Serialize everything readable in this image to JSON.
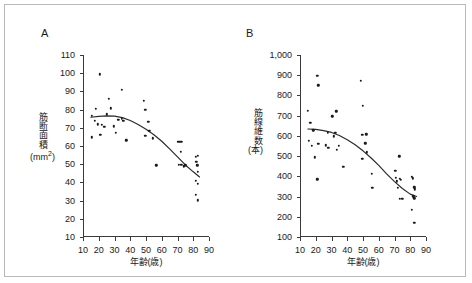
{
  "figure": {
    "panels": [
      {
        "label": "A",
        "ylabel_main": "筋断面積",
        "ylabel_unit": "(mm2)",
        "xlabel": "年齢(歳)"
      },
      {
        "label": "B",
        "ylabel_main": "筋線維数",
        "ylabel_unit": "(本)",
        "xlabel": "年齢(歳)"
      }
    ],
    "border_color": "#b9b9b9",
    "marker_color": "#1a1a1a",
    "axis_color": "#3a3a3a"
  },
  "chart_data": [
    {
      "type": "scatter",
      "panel": "A",
      "title": "",
      "xlabel": "年齢(歳)",
      "ylabel": "筋断面積 (mm2)",
      "xlim": [
        10,
        90
      ],
      "ylim": [
        10,
        110
      ],
      "xticks": [
        10,
        20,
        30,
        40,
        50,
        60,
        70,
        80,
        90
      ],
      "yticks": [
        10,
        20,
        30,
        40,
        50,
        60,
        70,
        80,
        90,
        100,
        110
      ],
      "xtick_labels": [
        "10",
        "20",
        "30",
        "40",
        "50",
        "60",
        "70",
        "80",
        "90"
      ],
      "ytick_labels": [
        "10",
        "20",
        "30",
        "40",
        "50",
        "60",
        "70",
        "80",
        "90",
        "100",
        "110"
      ],
      "grid": false,
      "legend": "none",
      "points": [
        [
          15.5,
          76.5
        ],
        [
          15.5,
          64.8
        ],
        [
          17.5,
          74.0
        ],
        [
          18.0,
          80.5
        ],
        [
          19.5,
          72.0
        ],
        [
          20.5,
          99.3
        ],
        [
          21.0,
          66.2
        ],
        [
          22.0,
          71.5
        ],
        [
          23.5,
          70.5
        ],
        [
          25.0,
          77.5
        ],
        [
          26.5,
          86.0
        ],
        [
          27.5,
          80.7
        ],
        [
          29.5,
          70.8
        ],
        [
          31.0,
          67.3
        ],
        [
          32.5,
          74.3
        ],
        [
          34.5,
          91.0
        ],
        [
          34.5,
          75.0
        ],
        [
          35.5,
          74.0
        ],
        [
          37.5,
          63.2
        ],
        [
          48.5,
          84.8
        ],
        [
          49.5,
          65.5
        ],
        [
          49.5,
          80.0
        ],
        [
          51.5,
          73.2
        ],
        [
          52.0,
          68.5
        ],
        [
          54.5,
          64.2
        ],
        [
          56.5,
          49.3
        ],
        [
          70.5,
          62.3
        ],
        [
          71.5,
          62.3
        ],
        [
          72.5,
          62.3
        ],
        [
          70.8,
          49.6
        ],
        [
          72.0,
          56.8
        ],
        [
          72.5,
          49.8
        ],
        [
          74.0,
          48.8
        ],
        [
          75.0,
          49.5
        ],
        [
          81.5,
          54.0
        ],
        [
          83.0,
          54.5
        ],
        [
          82.0,
          51.2
        ],
        [
          82.5,
          49.5
        ],
        [
          83.0,
          45.8
        ],
        [
          81.5,
          41.0
        ],
        [
          83.0,
          39.2
        ],
        [
          81.5,
          33.2
        ],
        [
          83.0,
          30.2
        ]
      ],
      "fit_curve": {
        "description": "quadratic decreasing trend line",
        "points": [
          [
            15,
            75.8
          ],
          [
            20,
            76.3
          ],
          [
            25,
            76.5
          ],
          [
            30,
            76.4
          ],
          [
            35,
            75.6
          ],
          [
            40,
            74.0
          ],
          [
            45,
            71.8
          ],
          [
            50,
            69.2
          ],
          [
            55,
            66.2
          ],
          [
            60,
            62.6
          ],
          [
            65,
            58.4
          ],
          [
            70,
            54.0
          ],
          [
            75,
            49.6
          ],
          [
            80,
            45.8
          ],
          [
            84,
            43.0
          ]
        ]
      }
    },
    {
      "type": "scatter",
      "panel": "B",
      "title": "",
      "xlabel": "年齢(歳)",
      "ylabel": "筋線維数 (本)",
      "xlim": [
        10,
        90
      ],
      "ylim": [
        100,
        1000
      ],
      "xticks": [
        10,
        20,
        30,
        40,
        50,
        60,
        70,
        80,
        90
      ],
      "yticks": [
        100,
        200,
        300,
        400,
        500,
        600,
        700,
        800,
        900,
        1000
      ],
      "xtick_labels": [
        "10",
        "20",
        "30",
        "40",
        "50",
        "60",
        "70",
        "80",
        "90"
      ],
      "ytick_labels": [
        "100",
        "200",
        "300",
        "400",
        "500",
        "600",
        "700",
        "800",
        "900",
        "1,000"
      ],
      "grid": false,
      "legend": "none",
      "points": [
        [
          15.0,
          723
        ],
        [
          15.5,
          576
        ],
        [
          16.5,
          665
        ],
        [
          17.5,
          550
        ],
        [
          18.5,
          628
        ],
        [
          19.5,
          494
        ],
        [
          21.0,
          897
        ],
        [
          21.5,
          851
        ],
        [
          21.0,
          385
        ],
        [
          21.5,
          560
        ],
        [
          26.5,
          553
        ],
        [
          27.5,
          614
        ],
        [
          28.0,
          540
        ],
        [
          30.5,
          697
        ],
        [
          31.5,
          598
        ],
        [
          32.5,
          614
        ],
        [
          33.0,
          722
        ],
        [
          33.5,
          530
        ],
        [
          34.5,
          552
        ],
        [
          37.5,
          448
        ],
        [
          48.5,
          872
        ],
        [
          49.5,
          605
        ],
        [
          49.5,
          487
        ],
        [
          50.0,
          748
        ],
        [
          51.5,
          563
        ],
        [
          52.5,
          519
        ],
        [
          52.0,
          607
        ],
        [
          55.5,
          412
        ],
        [
          56.0,
          343
        ],
        [
          70.5,
          428
        ],
        [
          71.0,
          392
        ],
        [
          71.5,
          375
        ],
        [
          72.0,
          342
        ],
        [
          73.0,
          500
        ],
        [
          73.5,
          389
        ],
        [
          74.0,
          383
        ],
        [
          73.5,
          289
        ],
        [
          75.0,
          290
        ],
        [
          81.0,
          399
        ],
        [
          81.5,
          390
        ],
        [
          82.5,
          345
        ],
        [
          83.0,
          336
        ],
        [
          82.0,
          302
        ],
        [
          82.5,
          292
        ],
        [
          81.0,
          233
        ],
        [
          82.5,
          170
        ]
      ],
      "fit_curve": {
        "description": "quadratic decreasing trend line",
        "points": [
          [
            15,
            634
          ],
          [
            20,
            632
          ],
          [
            25,
            626
          ],
          [
            30,
            617
          ],
          [
            35,
            602
          ],
          [
            40,
            581
          ],
          [
            45,
            556
          ],
          [
            50,
            526
          ],
          [
            55,
            492
          ],
          [
            60,
            454
          ],
          [
            65,
            412
          ],
          [
            70,
            374
          ],
          [
            75,
            340
          ],
          [
            80,
            312
          ],
          [
            84,
            300
          ]
        ]
      }
    }
  ]
}
